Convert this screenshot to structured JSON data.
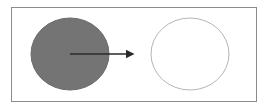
{
  "diagram": {
    "frame": {
      "x": 11,
      "y": 7,
      "w": 245,
      "h": 94,
      "stroke": "#8c8c8c"
    },
    "filled_circle": {
      "cx": 70,
      "cy": 54,
      "rx": 39,
      "ry": 36,
      "fill": "#747474",
      "stroke": "#6a6a6a"
    },
    "arrow": {
      "x1": 70,
      "y1": 54,
      "x2": 133,
      "y2": 54,
      "color": "#2a2a2a"
    },
    "outlined_circle": {
      "cx": 190,
      "cy": 54,
      "rx": 39,
      "ry": 36,
      "fill": "#ffffff",
      "stroke": "#b5b5b5"
    }
  }
}
